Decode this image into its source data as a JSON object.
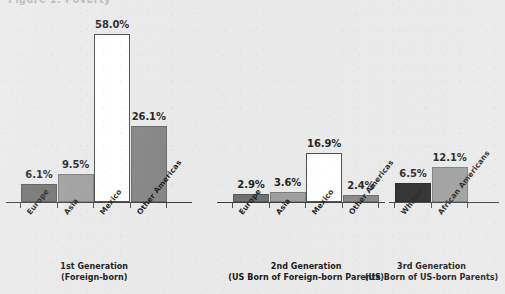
{
  "top_cut_text": "Figure 1. Poverty",
  "colors": {
    "background": "#e9e9ea",
    "axis": "#3a3a3a",
    "text": "#1d1d1d",
    "europe": "#6e6e6e",
    "asia": "#9c9c9c",
    "mexico": "#ffffff",
    "other_americas": "#848484",
    "whites": "#262626",
    "african_americans": "#9c9c9c"
  },
  "chart_data": {
    "type": "bar",
    "title": "",
    "xlabel": "",
    "ylabel": "",
    "ylim": [
      0,
      58
    ],
    "grid": false,
    "legend": "none",
    "value_format": "percent",
    "groups": [
      {
        "caption_line1": "1st Generation",
        "caption_line2": "(Foreign-born)",
        "categories": [
          "Europe",
          "Asia",
          "Mexico",
          "Other Americas"
        ],
        "values": [
          6.1,
          9.5,
          58.0,
          26.1
        ],
        "labels": [
          "6.1%",
          "9.5%",
          "58.0%",
          "26.1%"
        ],
        "colors": [
          "#6e6e6e",
          "#9c9c9c",
          "#ffffff",
          "#848484"
        ]
      },
      {
        "caption_line1": "2nd Generation",
        "caption_line2": "(US Born of Foreign-born Parents)",
        "categories": [
          "Europe",
          "Asia",
          "Mexico",
          "Other Americas"
        ],
        "values": [
          2.9,
          3.6,
          16.9,
          2.4
        ],
        "labels": [
          "2.9%",
          "3.6%",
          "16.9%",
          "2.4%"
        ],
        "colors": [
          "#6e6e6e",
          "#9c9c9c",
          "#ffffff",
          "#848484"
        ]
      },
      {
        "caption_line1": "3rd Generation",
        "caption_line2": "(US Born of US-born Parents)",
        "categories": [
          "Whites",
          "African Americans"
        ],
        "values": [
          6.5,
          12.1
        ],
        "labels": [
          "6.5%",
          "12.1%"
        ],
        "colors": [
          "#262626",
          "#9c9c9c"
        ]
      }
    ]
  }
}
